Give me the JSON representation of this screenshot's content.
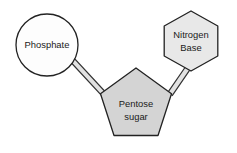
{
  "diagram": {
    "type": "nucleotide-structure",
    "background_color": "#ffffff",
    "nodes": [
      {
        "id": "phosphate",
        "shape": "circle",
        "label": "Phosphate",
        "label_lines": [
          "Phosphate"
        ],
        "fill_color": "#fdfdfd",
        "stroke_color": "#222222",
        "center": {
          "x": 47,
          "y": 45
        },
        "radius": 31
      },
      {
        "id": "pentose-sugar",
        "shape": "pentagon",
        "label": "Pentose sugar",
        "label_lines": [
          "Pentose",
          "sugar"
        ],
        "fill_color": "#d4d4d4",
        "stroke_color": "#222222",
        "center": {
          "x": 136,
          "y": 108
        },
        "radius": 41
      },
      {
        "id": "nitrogen-base",
        "shape": "hexagon",
        "label": "Nitrogen Base",
        "label_lines": [
          "Nitrogen",
          "Base"
        ],
        "fill_color": "#e8e8e8",
        "stroke_color": "#222222",
        "center": {
          "x": 191,
          "y": 41
        },
        "radius": 31
      }
    ],
    "bonds": [
      {
        "id": "phosphate-to-sugar",
        "style": "double-line",
        "from": "phosphate",
        "to": "pentose-sugar",
        "fill_color": "#e2e2e2",
        "stroke_color": "#333333"
      },
      {
        "id": "base-to-sugar",
        "style": "double-line",
        "from": "nitrogen-base",
        "to": "pentose-sugar",
        "fill_color": "#e2e2e2",
        "stroke_color": "#333333"
      }
    ]
  }
}
